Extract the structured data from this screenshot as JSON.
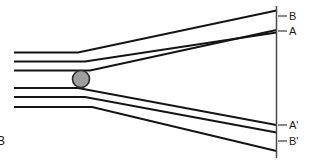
{
  "figure": {
    "labels": {
      "top_outer": "B",
      "top_inner": "A",
      "bottom_inner": "A'",
      "bottom_outer": "B'",
      "corner": "B"
    },
    "colors": {
      "ray_stroke": "#141414",
      "plane_stroke": "#4a4a4a",
      "tick_stroke": "#3c3c3c",
      "sphere_fill": "#9e9e9e",
      "sphere_stroke": "#2b2b2b",
      "background": "#ffffff",
      "text": "#1a1a1a"
    }
  },
  "chart_data": {
    "type": "line",
    "xlabel": "",
    "ylabel": "",
    "xlim": [
      0,
      313
    ],
    "ylim": [
      0,
      162
    ],
    "grid": false,
    "legend": null,
    "annotations": [
      {
        "text": "B",
        "x": 289,
        "y": 16
      },
      {
        "text": "A",
        "x": 289,
        "y": 31
      },
      {
        "text": "A'",
        "x": 289,
        "y": 125
      },
      {
        "text": "B'",
        "x": 289,
        "y": 141
      },
      {
        "text": "B",
        "x": 0,
        "y": 141
      }
    ],
    "elements": {
      "image_plane": {
        "x": 276.5,
        "y_top": 6,
        "y_bottom": 158
      },
      "sphere": {
        "cx": 81,
        "cy": 79,
        "r": 8.5
      },
      "ticks": [
        {
          "x1": 278,
          "x2": 287,
          "y": 16
        },
        {
          "x1": 278,
          "x2": 287,
          "y": 31
        },
        {
          "x1": 278,
          "x2": 287,
          "y": 125
        },
        {
          "x1": 278,
          "x2": 287,
          "y": 141
        }
      ]
    },
    "series": [
      {
        "name": "upper-ray-1",
        "x": [
          14,
          78,
          276.5
        ],
        "y": [
          52.5,
          52.5,
          10.5
        ]
      },
      {
        "name": "upper-ray-2",
        "x": [
          14,
          85,
          276.5
        ],
        "y": [
          61.5,
          61.5,
          32.5
        ]
      },
      {
        "name": "upper-ray-3",
        "x": [
          14,
          90,
          276.5
        ],
        "y": [
          70.5,
          70.5,
          30.0
        ]
      },
      {
        "name": "lower-ray-1",
        "x": [
          14,
          78,
          276.5
        ],
        "y": [
          88.0,
          88.0,
          125.0
        ]
      },
      {
        "name": "lower-ray-2",
        "x": [
          14,
          85,
          276.5
        ],
        "y": [
          97.0,
          97.0,
          132.5
        ]
      },
      {
        "name": "lower-ray-3",
        "x": [
          14,
          92,
          276.5
        ],
        "y": [
          107.0,
          107.0,
          151.0
        ]
      }
    ]
  }
}
